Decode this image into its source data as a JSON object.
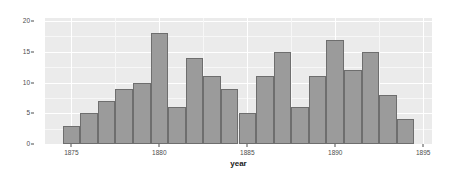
{
  "chart_data": {
    "type": "bar",
    "title": "",
    "xlabel": "year",
    "ylabel": "totalDeaths",
    "categories": [
      1875,
      1876,
      1877,
      1878,
      1879,
      1880,
      1881,
      1882,
      1883,
      1884,
      1885,
      1886,
      1887,
      1888,
      1889,
      1890,
      1891,
      1892,
      1893,
      1894
    ],
    "values": [
      3,
      5,
      7,
      9,
      10,
      18,
      6,
      14,
      11,
      9,
      5,
      11,
      15,
      6,
      11,
      17,
      12,
      15,
      8,
      4
    ],
    "series": [
      {
        "name": "totalDeaths",
        "values": [
          3,
          5,
          7,
          9,
          10,
          18,
          6,
          14,
          11,
          9,
          5,
          11,
          15,
          6,
          11,
          17,
          12,
          15,
          8,
          4
        ]
      }
    ],
    "xlim": [
      1873.5,
      1895.5
    ],
    "ylim": [
      0,
      20.5
    ],
    "x_ticks": [
      1875,
      1880,
      1885,
      1890,
      1895
    ],
    "x_tick_labels": [
      "1875",
      "1880",
      "1885",
      "1890",
      "1895"
    ],
    "x_minor_ticks": [
      1877.5,
      1882.5,
      1887.5,
      1892.5
    ],
    "y_ticks": [
      0,
      5,
      10,
      15,
      20
    ],
    "y_tick_labels": [
      "0",
      "5",
      "10",
      "15",
      "20"
    ],
    "y_minor_ticks": [
      2.5,
      7.5,
      12.5,
      17.5
    ],
    "grid": true,
    "legend": false,
    "legend_position": "none",
    "bar_width": 1.0,
    "colors": {
      "bar_fill": "#9b9b9b",
      "bar_border": "#6e6e6e",
      "panel_background": "#ebebeb",
      "grid_major": "#ffffff",
      "grid_minor": "#f7f7f7",
      "figure_background": "#ffffff",
      "axis_text": "#4d4d4d",
      "axis_title": "#1a1a1a"
    }
  }
}
